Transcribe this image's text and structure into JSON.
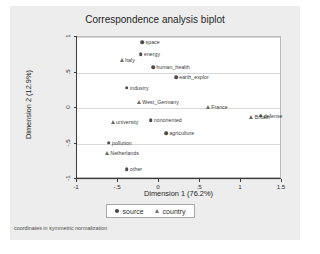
{
  "title": "Correspondence analysis biplot",
  "footnote": "coordinates in symmetric normalization",
  "legend": {
    "source_label": "source",
    "country_label": "country"
  },
  "chart_data": {
    "type": "scatter",
    "title": "Correspondence analysis biplot",
    "xlabel": "Dimension 1 (76.2%)",
    "ylabel": "Dimension 2 (12.9%)",
    "xlim": [
      -1,
      1.5
    ],
    "ylim": [
      -1,
      1
    ],
    "xticks": [
      -1,
      -0.5,
      0,
      0.5,
      1,
      1.5
    ],
    "xticklabels": [
      "-1",
      "-.5",
      "0",
      ".5",
      "1",
      "1.5"
    ],
    "yticks": [
      -1,
      -0.5,
      0,
      0.5,
      1
    ],
    "yticklabels": [
      "-1",
      "-.5",
      "0",
      ".5",
      "1"
    ],
    "grid": "horizontal",
    "legend_position": "bottom",
    "annotation": "coordinates in symmetric normalization",
    "series": [
      {
        "name": "source",
        "marker": "circle",
        "points": [
          {
            "label": "space",
            "x": -0.19,
            "y": 0.91
          },
          {
            "label": "energy",
            "x": -0.21,
            "y": 0.74
          },
          {
            "label": "human_health",
            "x": -0.06,
            "y": 0.56
          },
          {
            "label": "earth_explor",
            "x": 0.22,
            "y": 0.42
          },
          {
            "label": "industry",
            "x": -0.38,
            "y": 0.27
          },
          {
            "label": "nonoriented",
            "x": -0.09,
            "y": -0.19
          },
          {
            "label": "defense",
            "x": 1.25,
            "y": -0.12
          },
          {
            "label": "agriculture",
            "x": 0.1,
            "y": -0.37
          },
          {
            "label": "pollution",
            "x": -0.6,
            "y": -0.5
          },
          {
            "label": "other",
            "x": -0.38,
            "y": -0.88
          }
        ]
      },
      {
        "name": "country",
        "marker": "triangle",
        "points": [
          {
            "label": "Italy",
            "x": -0.44,
            "y": 0.66
          },
          {
            "label": "West_Germany",
            "x": -0.23,
            "y": 0.07
          },
          {
            "label": "France",
            "x": 0.61,
            "y": 0.0
          },
          {
            "label": "Britain",
            "x": 1.14,
            "y": -0.14
          },
          {
            "label": "university",
            "x": -0.55,
            "y": -0.21
          },
          {
            "label": "Netherlands",
            "x": -0.62,
            "y": -0.65
          }
        ]
      }
    ]
  }
}
